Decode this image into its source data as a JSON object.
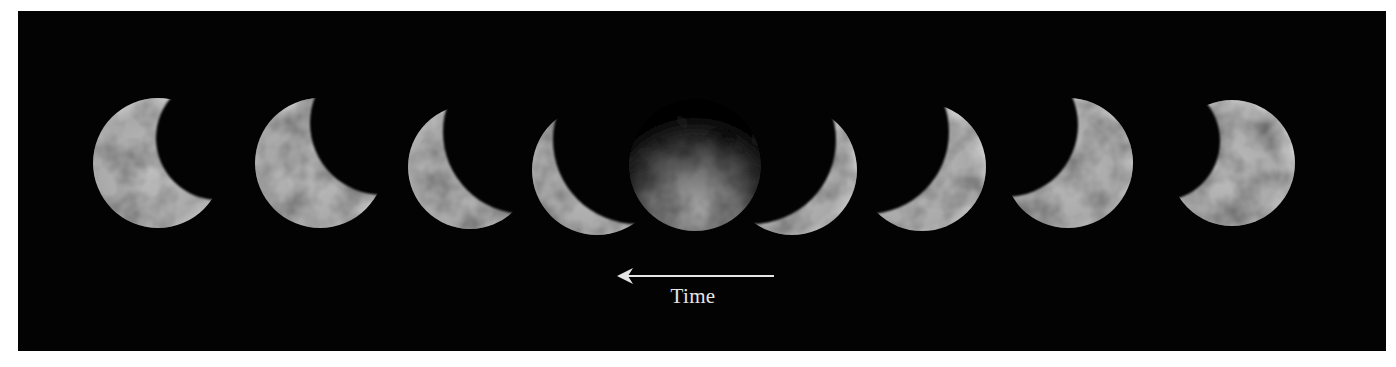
{
  "figure": {
    "background_color": "#030303",
    "moon_color": "#b8b8b8",
    "label_color": "#e6e6e6"
  },
  "phases": [
    {
      "index": 1,
      "cx": 158,
      "cy": 163,
      "r": 65,
      "shadow_dx": 60,
      "shadow_dy": -25,
      "shadow_r": 62
    },
    {
      "index": 2,
      "cx": 320,
      "cy": 163,
      "r": 65,
      "shadow_dx": 62,
      "shadow_dy": -40,
      "shadow_r": 72
    },
    {
      "index": 3,
      "cx": 470,
      "cy": 167,
      "r": 62,
      "shadow_dx": 55,
      "shadow_dy": -35,
      "shadow_r": 82
    },
    {
      "index": 4,
      "cx": 597,
      "cy": 170,
      "r": 65,
      "shadow_dx": 40,
      "shadow_dy": -30,
      "shadow_r": 84
    },
    {
      "index": 5,
      "cx": 695,
      "cy": 165,
      "r": 66,
      "eclipsed": true
    },
    {
      "index": 6,
      "cx": 792,
      "cy": 170,
      "r": 65,
      "shadow_dx": -40,
      "shadow_dy": -30,
      "shadow_r": 84
    },
    {
      "index": 7,
      "cx": 922,
      "cy": 167,
      "r": 64,
      "shadow_dx": -55,
      "shadow_dy": -35,
      "shadow_r": 82
    },
    {
      "index": 8,
      "cx": 1068,
      "cy": 163,
      "r": 65,
      "shadow_dx": -62,
      "shadow_dy": -38,
      "shadow_r": 72
    },
    {
      "index": 9,
      "cx": 1232,
      "cy": 163,
      "r": 63,
      "shadow_dx": -72,
      "shadow_dy": -22,
      "shadow_r": 60
    }
  ],
  "arrow": {
    "x1": 774,
    "x2": 617,
    "y": 276,
    "direction": "left"
  },
  "labels": {
    "time": "Time"
  }
}
